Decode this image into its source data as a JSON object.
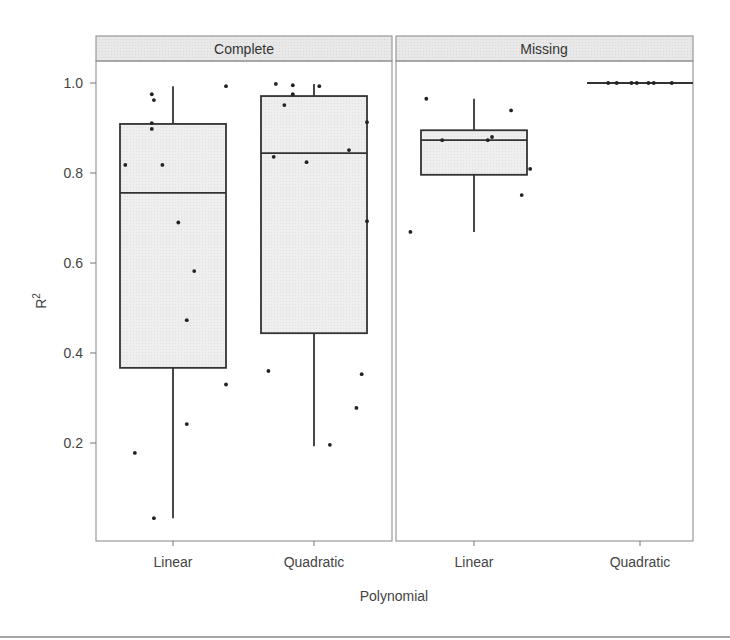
{
  "chart_data": {
    "type": "boxplot",
    "title": "",
    "xlabel": "Polynomial",
    "ylabel": "R",
    "ylabel_superscript": "2",
    "y_ticks": [
      0.2,
      0.4,
      0.6,
      0.8,
      1.0
    ],
    "y_tick_labels": [
      "0.2",
      "0.4",
      "0.6",
      "0.8",
      "1.0"
    ],
    "ylim": [
      0.0,
      1.0
    ],
    "categories": [
      "Linear",
      "Quadratic"
    ],
    "grid": false,
    "legend": null,
    "panels": [
      {
        "name": "Complete",
        "boxes": [
          {
            "category": "Linear",
            "whisker_low": 0.033,
            "q1": 0.367,
            "median": 0.756,
            "q3": 0.909,
            "whisker_high": 0.993,
            "points": [
              {
                "dx": -0.45,
                "y": 0.818
              },
              {
                "dx": -0.2,
                "y": 0.975
              },
              {
                "dx": -0.18,
                "y": 0.962
              },
              {
                "dx": -0.2,
                "y": 0.911
              },
              {
                "dx": -0.2,
                "y": 0.898
              },
              {
                "dx": -0.1,
                "y": 0.818
              },
              {
                "dx": 0.05,
                "y": 0.69
              },
              {
                "dx": 0.2,
                "y": 0.582
              },
              {
                "dx": 0.13,
                "y": 0.473
              },
              {
                "dx": 0.5,
                "y": 0.33
              },
              {
                "dx": 0.13,
                "y": 0.242
              },
              {
                "dx": -0.36,
                "y": 0.178
              },
              {
                "dx": -0.18,
                "y": 0.033
              },
              {
                "dx": 0.5,
                "y": 0.993
              }
            ]
          },
          {
            "category": "Quadratic",
            "whisker_low": 0.193,
            "q1": 0.444,
            "median": 0.844,
            "q3": 0.971,
            "whisker_high": 0.998,
            "points": [
              {
                "dx": -0.36,
                "y": 0.998
              },
              {
                "dx": -0.2,
                "y": 0.995
              },
              {
                "dx": -0.2,
                "y": 0.975
              },
              {
                "dx": 0.05,
                "y": 0.993
              },
              {
                "dx": -0.28,
                "y": 0.951
              },
              {
                "dx": 0.5,
                "y": 0.913
              },
              {
                "dx": -0.38,
                "y": 0.836
              },
              {
                "dx": -0.07,
                "y": 0.824
              },
              {
                "dx": 0.33,
                "y": 0.851
              },
              {
                "dx": 0.5,
                "y": 0.693
              },
              {
                "dx": -0.43,
                "y": 0.36
              },
              {
                "dx": 0.45,
                "y": 0.353
              },
              {
                "dx": 0.4,
                "y": 0.278
              },
              {
                "dx": 0.15,
                "y": 0.196
              }
            ]
          }
        ]
      },
      {
        "name": "Missing",
        "boxes": [
          {
            "category": "Linear",
            "whisker_low": 0.669,
            "q1": 0.796,
            "median": 0.873,
            "q3": 0.895,
            "whisker_high": 0.965,
            "points": [
              {
                "dx": -0.45,
                "y": 0.965
              },
              {
                "dx": -0.3,
                "y": 0.873
              },
              {
                "dx": 0.13,
                "y": 0.873
              },
              {
                "dx": 0.17,
                "y": 0.88
              },
              {
                "dx": 0.35,
                "y": 0.939
              },
              {
                "dx": 0.53,
                "y": 0.809
              },
              {
                "dx": 0.45,
                "y": 0.751
              },
              {
                "dx": -0.6,
                "y": 0.669
              }
            ]
          },
          {
            "category": "Quadratic",
            "whisker_low": 1.0,
            "q1": 1.0,
            "median": 1.0,
            "q3": 1.0,
            "whisker_high": 1.0,
            "points": [
              {
                "dx": -0.3,
                "y": 1.0
              },
              {
                "dx": -0.22,
                "y": 1.0
              },
              {
                "dx": -0.08,
                "y": 1.0
              },
              {
                "dx": -0.03,
                "y": 1.0
              },
              {
                "dx": 0.08,
                "y": 1.0
              },
              {
                "dx": 0.13,
                "y": 1.0
              },
              {
                "dx": 0.3,
                "y": 1.0
              }
            ]
          }
        ]
      }
    ]
  },
  "colors": {
    "box_fill": "#ececec",
    "strip_fill": "#e6e6e6",
    "frame": "#999999",
    "box_line": "#333333",
    "point": "#222222",
    "text": "#444444"
  }
}
